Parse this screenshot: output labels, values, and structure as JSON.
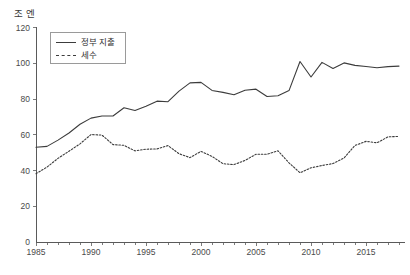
{
  "chart_data": {
    "type": "line",
    "title": "",
    "subtitle": "",
    "xlabel": "",
    "ylabel": "조 엔",
    "unit_label": "조 엔",
    "xlim": [
      1985,
      2018
    ],
    "ylim": [
      0,
      120
    ],
    "ytick_values": [
      0,
      20,
      40,
      60,
      80,
      100,
      120
    ],
    "ytick_labels": [
      "0",
      "20",
      "40",
      "60",
      "80",
      "100",
      "120"
    ],
    "xtick_values": [
      1985,
      1990,
      1995,
      2000,
      2005,
      2010,
      2015
    ],
    "xtick_labels": [
      "1985",
      "1990",
      "1995",
      "2000",
      "2005",
      "2010",
      "2015"
    ],
    "minor_xticks_every": 1,
    "grid": false,
    "legend_position": "upper-left-inset",
    "x": [
      1985,
      1986,
      1987,
      1988,
      1989,
      1990,
      1991,
      1992,
      1993,
      1994,
      1995,
      1996,
      1997,
      1998,
      1999,
      2000,
      2001,
      2002,
      2003,
      2004,
      2005,
      2006,
      2007,
      2008,
      2009,
      2010,
      2011,
      2012,
      2013,
      2014,
      2015,
      2016,
      2017,
      2018
    ],
    "series": [
      {
        "name": "정부 지출",
        "style": "solid",
        "color": "#3c3c3c",
        "values": [
          53,
          53.5,
          57,
          61,
          65.9,
          69.3,
          70.5,
          70.5,
          75.1,
          73.6,
          75.9,
          78.8,
          78.5,
          84.4,
          89,
          89.3,
          84.8,
          83.7,
          82.4,
          84.9,
          85.5,
          81.4,
          81.8,
          84.7,
          101,
          92.3,
          100.5,
          97.1,
          100.2,
          98.8,
          98.2,
          97.5,
          98.1,
          98.4
        ]
      },
      {
        "name": "세수",
        "style": "dashed",
        "color": "#3c3c3c",
        "values": [
          38.2,
          41.9,
          46.8,
          50.8,
          54.9,
          60.1,
          59.8,
          54.5,
          54.1,
          51,
          51.9,
          52.1,
          53.9,
          49.4,
          47.2,
          50.7,
          47.9,
          43.8,
          43.3,
          45.6,
          49.1,
          49.1,
          51,
          44.3,
          38.7,
          41.5,
          42.8,
          43.9,
          47,
          54,
          56.3,
          55.5,
          58.8,
          59.1
        ]
      }
    ]
  },
  "legend": {
    "items": [
      {
        "label": "정부 지출",
        "style": "solid"
      },
      {
        "label": "세수",
        "style": "dashed"
      }
    ]
  }
}
